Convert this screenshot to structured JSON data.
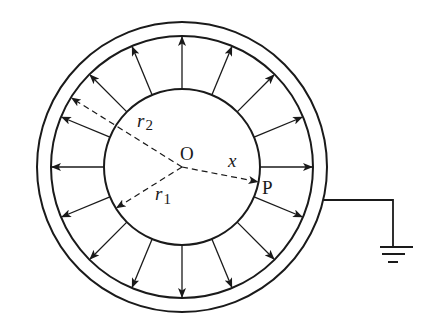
{
  "figure": {
    "center": {
      "x": 182,
      "y": 167
    },
    "radii_px": {
      "inner_sphere": 78,
      "shell_inner": 131,
      "shell_outer": 145
    },
    "field_arrow_count": 16,
    "colors": {
      "stroke": "#1a1a1a",
      "background": "#ffffff"
    },
    "labels": {
      "center": "O",
      "inner_radius_main": "r",
      "inner_radius_sub": "1",
      "outer_radius_main": "r",
      "outer_radius_sub": "2",
      "distance": "x",
      "point": "P"
    },
    "radius_lines": {
      "r2_angle_deg": 148,
      "r1_angle_deg": 212,
      "x_angle_deg": -11
    },
    "ground": {
      "wire_y": 200,
      "wire_x_end": 393,
      "drop_y_end": 247,
      "bars": [
        {
          "y": 247,
          "x1": 380,
          "x2": 413
        },
        {
          "y": 254,
          "x1": 382,
          "x2": 405
        },
        {
          "y": 262,
          "x1": 388,
          "x2": 398
        }
      ]
    }
  }
}
